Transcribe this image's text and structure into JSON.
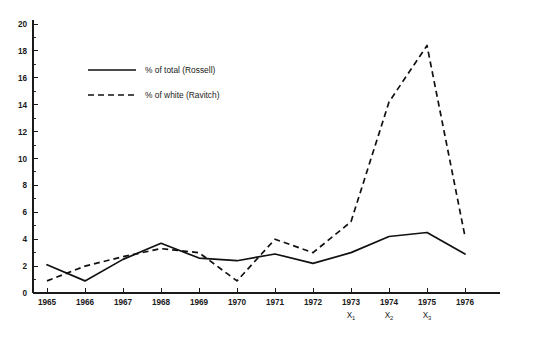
{
  "chart_data": {
    "type": "line",
    "title": "",
    "subtitle": "",
    "xlabel": "",
    "ylabel": "",
    "x": [
      1965,
      1966,
      1967,
      1968,
      1969,
      1970,
      1971,
      1972,
      1973,
      1974,
      1975,
      1976
    ],
    "categories": [
      "1965",
      "1966",
      "1967",
      "1968",
      "1969",
      "1970",
      "1971",
      "1972",
      "1973",
      "1974",
      "1975",
      "1976"
    ],
    "xlim": [
      1965,
      1976
    ],
    "ylim": [
      0,
      20
    ],
    "y_ticks": [
      0,
      2,
      4,
      6,
      8,
      10,
      12,
      14,
      16,
      18,
      20
    ],
    "y_tick_labels": [
      "0",
      "2",
      "4",
      "6",
      "8",
      "10",
      "12",
      "14",
      "16",
      "18",
      "20"
    ],
    "y_minor_step": 1,
    "grid": false,
    "legend_position": "upper-left-inside",
    "series": [
      {
        "name": "% of total (Rossell)",
        "style": "solid",
        "color": "#111111",
        "values": [
          2.1,
          0.9,
          2.5,
          3.7,
          2.6,
          2.4,
          2.9,
          2.2,
          3.0,
          4.2,
          4.5,
          2.9
        ]
      },
      {
        "name": "% of white (Ravitch)",
        "style": "dashed",
        "color": "#111111",
        "values": [
          0.9,
          2.0,
          2.7,
          3.3,
          3.0,
          0.9,
          4.0,
          3.0,
          5.3,
          14.2,
          18.4,
          4.2
        ]
      }
    ],
    "annotations": [
      {
        "label": "X",
        "subscript": "1",
        "at_category": "1973"
      },
      {
        "label": "X",
        "subscript": "2",
        "at_category": "1974"
      },
      {
        "label": "X",
        "subscript": "3",
        "at_category": "1975"
      }
    ]
  },
  "legend": {
    "items": [
      {
        "label": "% of total (Rossell)",
        "style": "solid"
      },
      {
        "label": "% of white (Ravitch)",
        "style": "dashed"
      }
    ]
  }
}
